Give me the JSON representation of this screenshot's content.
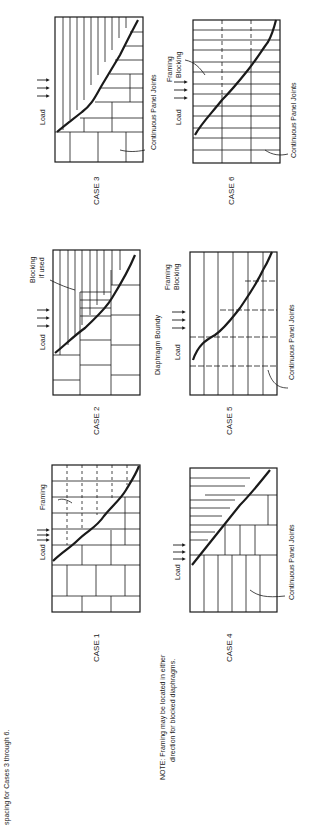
{
  "page": {
    "cut_caption": "spacing for Cases 3 through 6.",
    "note_line1": "NOTE:  Framing may be located in either",
    "note_line2": "direction for blocked diaphragms."
  },
  "cases": [
    {
      "id": 1,
      "label": "CASE 1",
      "load": "Load",
      "callouts": [
        "Framing"
      ]
    },
    {
      "id": 2,
      "label": "CASE 2",
      "load": "Load",
      "callouts": [
        "Blocking",
        "if used"
      ]
    },
    {
      "id": 3,
      "label": "CASE 3",
      "load": "Load",
      "callouts": [
        "Continuous Panel Joints"
      ]
    },
    {
      "id": 4,
      "label": "CASE 4",
      "load": "Load",
      "callouts": [
        "Continuous Panel Joints"
      ]
    },
    {
      "id": 5,
      "label": "CASE 5",
      "load": "Load",
      "callouts": [
        "Diaphragm Boundy",
        "Framing",
        "Blocking",
        "Continuous Panel Joints"
      ]
    },
    {
      "id": 6,
      "label": "CASE 6",
      "load": "Load",
      "callouts": [
        "Framing",
        "Blocking",
        "Continuous Panel Joints"
      ]
    }
  ],
  "colors": {
    "ink": "#1a1a1a",
    "paper": "#ffffff"
  }
}
